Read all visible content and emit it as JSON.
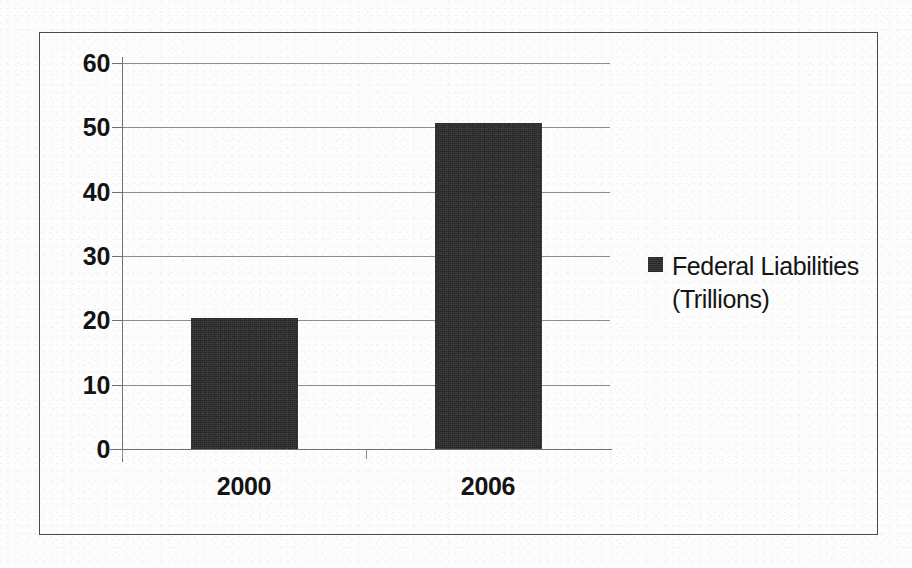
{
  "chart_data": {
    "type": "bar",
    "title": "",
    "subtitle": "",
    "xlabel": "",
    "ylabel": "",
    "categories": [
      "2000",
      "2006"
    ],
    "values": [
      20.3,
      50.6
    ],
    "series": [
      {
        "name": "Federal Liabilities (Trillions)",
        "values": [
          20.3,
          50.6
        ],
        "color": "#262626"
      }
    ],
    "ylim": [
      0,
      60
    ],
    "y_ticks": [
      0,
      10,
      20,
      30,
      40,
      50,
      60
    ],
    "y_tick_labels": [
      "0",
      "10",
      "20",
      "30",
      "40",
      "50",
      "60"
    ],
    "grid": true,
    "grid_axis": "y",
    "legend": {
      "position": "right",
      "entries": [
        {
          "label_line_1": "Federal Liabilities",
          "label_line_2": "(Trillions)",
          "full_label": "Federal Liabilities (Trillions)",
          "marker": "filled-square",
          "color": "#262626"
        }
      ]
    },
    "frame": {
      "border_color": "#4a4a4a",
      "background": "#ffffff"
    },
    "axis_color": "#6f6f6f",
    "gridline_color": "#8d8d8d",
    "text_color": "#141414"
  }
}
